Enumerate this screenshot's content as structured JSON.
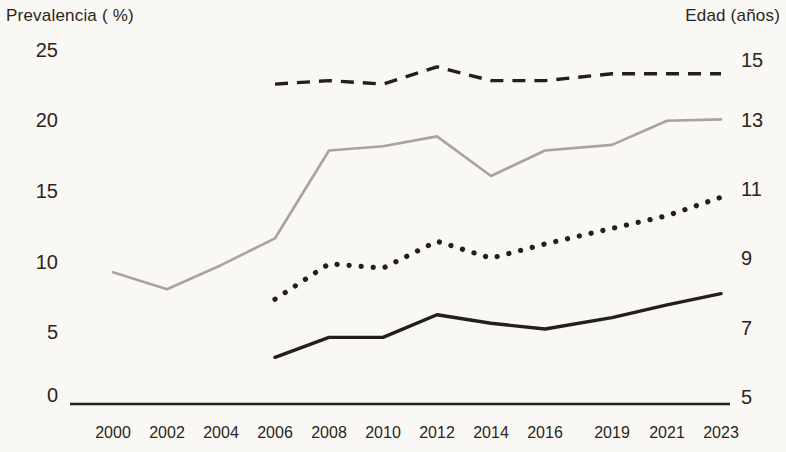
{
  "chart_data": {
    "type": "line",
    "title": "",
    "ylabel_left": "Prevalencia ( %)",
    "ylabel_right": "Edad (años)",
    "xlabel": "",
    "categories": [
      "2000",
      "2002",
      "2004",
      "2006",
      "2008",
      "2010",
      "2012",
      "2014",
      "2016",
      "2019",
      "2021",
      "2023"
    ],
    "left_axis": {
      "ticks": [
        "25",
        "20",
        "15",
        "10",
        "5",
        "0"
      ],
      "values": [
        25,
        20,
        15,
        10,
        5,
        0
      ],
      "ylim": [
        0,
        25
      ]
    },
    "right_axis": {
      "ticks": [
        "15",
        "13",
        "11",
        "9",
        "7",
        "5"
      ],
      "values": [
        15,
        13,
        11,
        9,
        7,
        5
      ],
      "ylim": [
        5,
        15
      ]
    },
    "grid": false,
    "legend_position": "none",
    "series": [
      {
        "name": "serie-gris-continua",
        "axis": "left",
        "style": "solid",
        "color": "#a9a49a",
        "x": [
          "2000",
          "2002",
          "2004",
          "2006",
          "2008",
          "2010",
          "2012",
          "2014",
          "2016",
          "2019",
          "2021",
          "2023"
        ],
        "values": [
          9.3,
          8.1,
          9.8,
          11.7,
          17.9,
          18.2,
          18.9,
          16.1,
          17.9,
          18.3,
          20.0,
          20.1
        ]
      },
      {
        "name": "serie-negra-discontinua",
        "axis": "right",
        "style": "dashed",
        "color": "#231f1c",
        "x": [
          "2006",
          "2008",
          "2010",
          "2012",
          "2014",
          "2016",
          "2019",
          "2021",
          "2023"
        ],
        "values": [
          14.3,
          14.4,
          14.3,
          14.8,
          14.4,
          14.4,
          14.6,
          14.6,
          14.6
        ]
      },
      {
        "name": "serie-negra-punteada",
        "axis": "left",
        "style": "dotted",
        "color": "#231f1c",
        "x": [
          "2006",
          "2008",
          "2010",
          "2012",
          "2014",
          "2016",
          "2019",
          "2021",
          "2023"
        ],
        "values": [
          7.4,
          9.9,
          9.6,
          11.5,
          10.3,
          11.3,
          12.4,
          13.3,
          14.6
        ]
      },
      {
        "name": "serie-negra-continua",
        "axis": "left",
        "style": "solid",
        "color": "#231f1c",
        "x": [
          "2006",
          "2008",
          "2010",
          "2012",
          "2014",
          "2016",
          "2019",
          "2021",
          "2023"
        ],
        "values": [
          3.3,
          4.7,
          4.7,
          6.3,
          5.7,
          5.3,
          6.1,
          7.0,
          7.8
        ]
      }
    ],
    "baseline_axis_color": "#231f1c"
  }
}
